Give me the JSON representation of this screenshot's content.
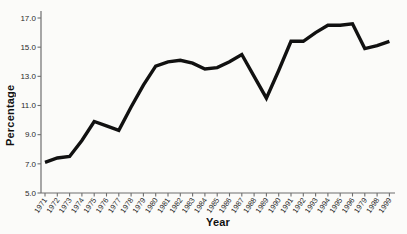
{
  "chart_data": {
    "type": "line",
    "title": "",
    "xlabel": "Year",
    "ylabel": "Percentage",
    "categories": [
      "1971",
      "1972",
      "1973",
      "1974",
      "1975",
      "1976",
      "1977",
      "1978",
      "1979",
      "1980",
      "1981",
      "1982",
      "1983",
      "1984",
      "1985",
      "1986",
      "1987",
      "1988",
      "1989",
      "1990",
      "1991",
      "1992",
      "1993",
      "1994",
      "1995",
      "1996",
      "1979",
      "1998",
      "1999"
    ],
    "values": [
      7.1,
      7.4,
      7.5,
      8.6,
      9.9,
      9.6,
      9.3,
      10.9,
      12.4,
      13.7,
      14.0,
      14.1,
      13.9,
      13.5,
      13.6,
      14.0,
      14.5,
      13.0,
      11.5,
      13.4,
      15.4,
      15.4,
      16.0,
      16.5,
      16.5,
      16.6,
      14.9,
      15.1,
      15.4
    ],
    "y_ticks": [
      5.0,
      7.0,
      9.0,
      11.0,
      13.0,
      15.0,
      17.0
    ],
    "y_tick_labels": [
      "5.0",
      "7.0",
      "9.0",
      "11.0",
      "13.0",
      "15.0",
      "17.0"
    ],
    "ylim": [
      5.0,
      17.0
    ],
    "grid": false,
    "legend": "none",
    "line_color": "#111111",
    "axis_color": "#6f6f6f",
    "tick_label_color": "#2a2a2a",
    "background": "#fbfbf9",
    "x_tick_label_note": "label between 1996 and 1998 printed as 1979 in source figure"
  }
}
